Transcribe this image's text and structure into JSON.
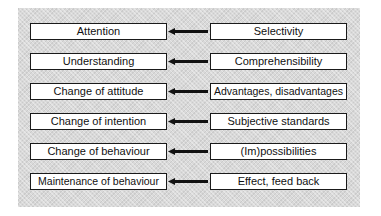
{
  "diagram": {
    "rows": [
      {
        "stage": "Attention",
        "factor": "Selectivity"
      },
      {
        "stage": "Understanding",
        "factor": "Comprehensibility"
      },
      {
        "stage": "Change of attitude",
        "factor": "Advantages, disadvantages"
      },
      {
        "stage": "Change of intention",
        "factor": "Subjective standards"
      },
      {
        "stage": "Change of behaviour",
        "factor": "(Im)possibilities"
      },
      {
        "stage": "Maintenance of behaviour",
        "factor": "Effect, feed back"
      }
    ],
    "colors": {
      "panel": "#d9d9d9",
      "box": "#ffffff",
      "border": "#1a1a1a",
      "arrow": "#111111"
    }
  }
}
